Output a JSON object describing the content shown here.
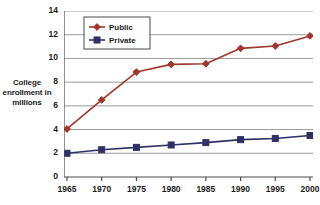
{
  "chart_data": {
    "type": "line",
    "title": "",
    "xlabel": "",
    "ylabel": "College enrollment in millions",
    "categories": [
      "1965",
      "1970",
      "1975",
      "1980",
      "1985",
      "1990",
      "1995",
      "2000"
    ],
    "series": [
      {
        "name": "Public",
        "color": "#A0372B",
        "marker": "diamond",
        "values": [
          4.05,
          6.5,
          8.85,
          9.5,
          9.55,
          10.85,
          11.05,
          11.9
        ]
      },
      {
        "name": "Private",
        "color": "#2D3166",
        "marker": "square",
        "values": [
          2.0,
          2.3,
          2.5,
          2.7,
          2.9,
          3.15,
          3.25,
          3.5
        ]
      }
    ],
    "ylim": [
      0,
      14
    ],
    "yticks": [
      "0",
      "2",
      "4",
      "6",
      "8",
      "10",
      "12",
      "14"
    ],
    "ytick_values": [
      0,
      2,
      4,
      6,
      8,
      10,
      12,
      14
    ],
    "grid": "horizontal",
    "legend_position": "top-left-inside"
  },
  "axis": {
    "y_title_lines": [
      "College",
      "enrollment in",
      "millions"
    ]
  },
  "legend": {
    "entries": [
      {
        "label": "Public"
      },
      {
        "label": "Private"
      }
    ]
  },
  "colors": {
    "public": "#A0372B",
    "private": "#2D3166",
    "grid": "#9a9a9a",
    "axis": "#4a4a4a",
    "text": "#1b1b1b",
    "background": "#ffffff"
  }
}
